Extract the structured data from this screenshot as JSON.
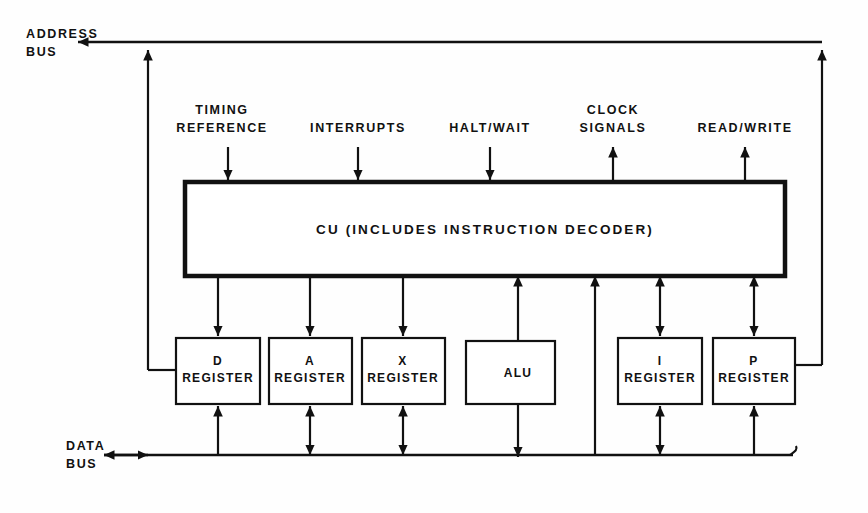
{
  "diagram": {
    "ink_color": "#111111",
    "background_color": "#ffffff",
    "buses": [
      {
        "id": "address-bus",
        "label_line1": "ADDRESS",
        "label_line2": "BUS",
        "direction": "left",
        "position": "top"
      },
      {
        "id": "data-bus",
        "label_line1": "DATA",
        "label_line2": "BUS",
        "direction": "bidirectional",
        "position": "bottom"
      }
    ],
    "control_unit": {
      "id": "cu-block",
      "label": "CU (INCLUDES INSTRUCTION DECODER)"
    },
    "signals": [
      {
        "id": "timing-reference",
        "line1": "TIMING",
        "line2": "REFERENCE",
        "direction": "in"
      },
      {
        "id": "interrupts",
        "line1": "INTERRUPTS",
        "line2": "",
        "direction": "in"
      },
      {
        "id": "halt-wait",
        "line1": "HALT/WAIT",
        "line2": "",
        "direction": "in"
      },
      {
        "id": "clock-signals",
        "line1": "CLOCK",
        "line2": "SIGNALS",
        "direction": "out"
      },
      {
        "id": "read-write",
        "line1": "READ/WRITE",
        "line2": "",
        "direction": "out"
      }
    ],
    "blocks": [
      {
        "id": "d-register",
        "line1": "D",
        "line2": "REGISTER"
      },
      {
        "id": "a-register",
        "line1": "A",
        "line2": "REGISTER"
      },
      {
        "id": "x-register",
        "line1": "X",
        "line2": "REGISTER"
      },
      {
        "id": "alu",
        "line1": "ALU",
        "line2": ""
      },
      {
        "id": "i-register",
        "line1": "I",
        "line2": "REGISTER"
      },
      {
        "id": "p-register",
        "line1": "P",
        "line2": "REGISTER"
      }
    ]
  }
}
